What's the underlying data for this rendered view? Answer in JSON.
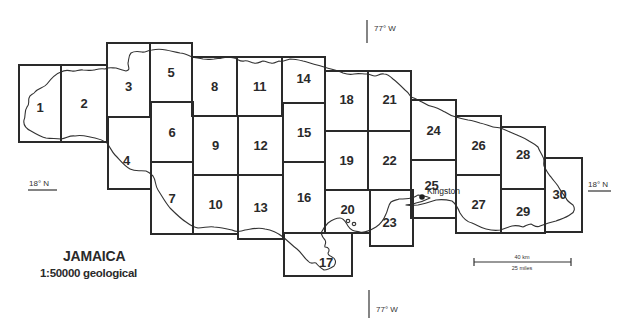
{
  "map": {
    "title": "JAMAICA",
    "subtitle": "1:50000 geological",
    "sheet_outline_color": "#2a2a2a",
    "coastline_color": "#333333"
  },
  "graticule": {
    "meridian_top_label": "77° W",
    "meridian_bottom_label": "77° W",
    "parallel_left_label": "18° N",
    "parallel_right_label": "18° N"
  },
  "places": {
    "kingston": {
      "label": "Kingston",
      "marker": "city-dot-icon"
    }
  },
  "scale_bar": {
    "km_label": "40 km",
    "miles_label": "25 miles"
  },
  "sheets": [
    {
      "id": "1",
      "label": "1",
      "x": 19,
      "y": 65,
      "w": 42,
      "h": 77
    },
    {
      "id": "2",
      "label": "2",
      "x": 61,
      "y": 65,
      "w": 46,
      "h": 77
    },
    {
      "id": "3",
      "label": "3",
      "x": 107,
      "y": 43,
      "w": 43,
      "h": 74
    },
    {
      "id": "4",
      "label": "4",
      "x": 108,
      "y": 117,
      "w": 43,
      "h": 72
    },
    {
      "id": "5",
      "label": "5",
      "x": 150,
      "y": 43,
      "w": 42,
      "h": 59
    },
    {
      "id": "6",
      "label": "6",
      "x": 151,
      "y": 102,
      "w": 42,
      "h": 60
    },
    {
      "id": "7",
      "label": "7",
      "x": 151,
      "y": 162,
      "w": 42,
      "h": 72
    },
    {
      "id": "8",
      "label": "8",
      "x": 192,
      "y": 57,
      "w": 45,
      "h": 59
    },
    {
      "id": "9",
      "label": "9",
      "x": 193,
      "y": 116,
      "w": 45,
      "h": 59
    },
    {
      "id": "10",
      "label": "10",
      "x": 193,
      "y": 175,
      "w": 45,
      "h": 59
    },
    {
      "id": "11",
      "label": "11",
      "x": 237,
      "y": 57,
      "w": 45,
      "h": 59
    },
    {
      "id": "12",
      "label": "12",
      "x": 238,
      "y": 116,
      "w": 45,
      "h": 59
    },
    {
      "id": "13",
      "label": "13",
      "x": 238,
      "y": 175,
      "w": 45,
      "h": 64
    },
    {
      "id": "14",
      "label": "14",
      "x": 282,
      "y": 57,
      "w": 43,
      "h": 46
    },
    {
      "id": "15",
      "label": "15",
      "x": 283,
      "y": 103,
      "w": 42,
      "h": 59
    },
    {
      "id": "16",
      "label": "16",
      "x": 283,
      "y": 162,
      "w": 42,
      "h": 71
    },
    {
      "id": "17",
      "label": "17",
      "x": 284,
      "y": 233,
      "w": 68,
      "h": 43
    },
    {
      "id": "18",
      "label": "18",
      "x": 325,
      "y": 71,
      "w": 43,
      "h": 60
    },
    {
      "id": "19",
      "label": "19",
      "x": 325,
      "y": 131,
      "w": 43,
      "h": 59
    },
    {
      "id": "20",
      "label": "20",
      "x": 325,
      "y": 190,
      "w": 45,
      "h": 43
    },
    {
      "id": "21",
      "label": "21",
      "x": 368,
      "y": 71,
      "w": 43,
      "h": 60
    },
    {
      "id": "22",
      "label": "22",
      "x": 368,
      "y": 131,
      "w": 43,
      "h": 59
    },
    {
      "id": "23",
      "label": "23",
      "x": 370,
      "y": 190,
      "w": 43,
      "h": 56
    },
    {
      "id": "24",
      "label": "24",
      "x": 411,
      "y": 100,
      "w": 45,
      "h": 60
    },
    {
      "id": "25",
      "label": "25",
      "x": 411,
      "y": 160,
      "w": 45,
      "h": 58
    },
    {
      "id": "26",
      "label": "26",
      "x": 456,
      "y": 116,
      "w": 45,
      "h": 59
    },
    {
      "id": "27",
      "label": "27",
      "x": 456,
      "y": 175,
      "w": 45,
      "h": 58
    },
    {
      "id": "28",
      "label": "28",
      "x": 501,
      "y": 127,
      "w": 44,
      "h": 62
    },
    {
      "id": "29",
      "label": "29",
      "x": 501,
      "y": 189,
      "w": 44,
      "h": 44
    },
    {
      "id": "30",
      "label": "30",
      "x": 545,
      "y": 158,
      "w": 37,
      "h": 74
    }
  ]
}
